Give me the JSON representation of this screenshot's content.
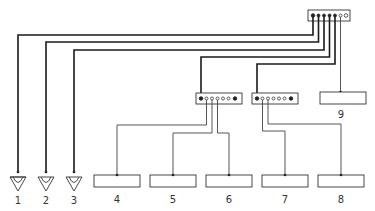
{
  "diagram": {
    "type": "wiring-schematic",
    "colors": {
      "line": "#1a1a1a",
      "thin_line": "#444444",
      "background": "#ffffff"
    },
    "main_distributor": {
      "terminals": 7
    },
    "sub_distributors": [
      {
        "id": "A",
        "terminals": 7
      },
      {
        "id": "B",
        "terminals": 7
      }
    ],
    "speakers": [
      {
        "label": "1"
      },
      {
        "label": "2"
      },
      {
        "label": "3"
      }
    ],
    "devices": [
      {
        "label": "4"
      },
      {
        "label": "5"
      },
      {
        "label": "6"
      },
      {
        "label": "7"
      },
      {
        "label": "8"
      },
      {
        "label": "9"
      }
    ]
  }
}
